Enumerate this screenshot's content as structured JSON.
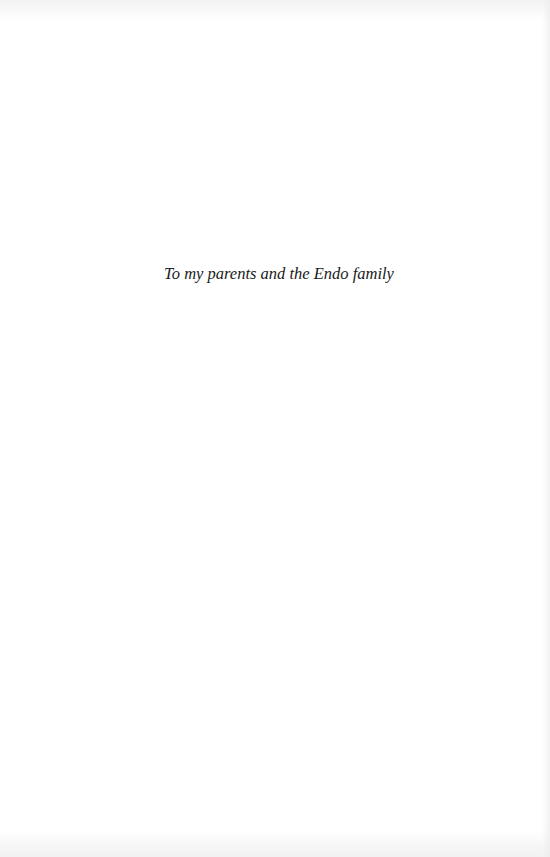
{
  "page": {
    "type": "dedication",
    "background_color": "#ffffff",
    "text_color": "#1a1a1a"
  },
  "dedication": {
    "text": "To my parents and the Endo family"
  }
}
